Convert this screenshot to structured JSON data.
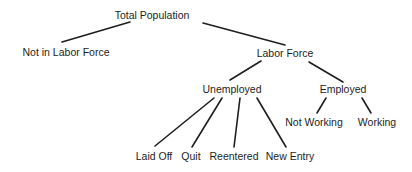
{
  "diagram": {
    "type": "tree",
    "nodes": {
      "total_population": "Total Population",
      "not_in_labor_force": "Not in Labor Force",
      "labor_force": "Labor Force",
      "unemployed": "Unemployed",
      "employed": "Employed",
      "laid_off": "Laid Off",
      "quit": "Quit",
      "reentered": "Reentered",
      "new_entry": "New Entry",
      "not_working": "Not Working",
      "working": "Working"
    },
    "edges": [
      [
        "Total Population",
        "Not in Labor Force"
      ],
      [
        "Total Population",
        "Labor Force"
      ],
      [
        "Labor Force",
        "Unemployed"
      ],
      [
        "Labor Force",
        "Employed"
      ],
      [
        "Unemployed",
        "Laid Off"
      ],
      [
        "Unemployed",
        "Quit"
      ],
      [
        "Unemployed",
        "Reentered"
      ],
      [
        "Unemployed",
        "New Entry"
      ],
      [
        "Employed",
        "Not Working"
      ],
      [
        "Employed",
        "Working"
      ]
    ]
  }
}
